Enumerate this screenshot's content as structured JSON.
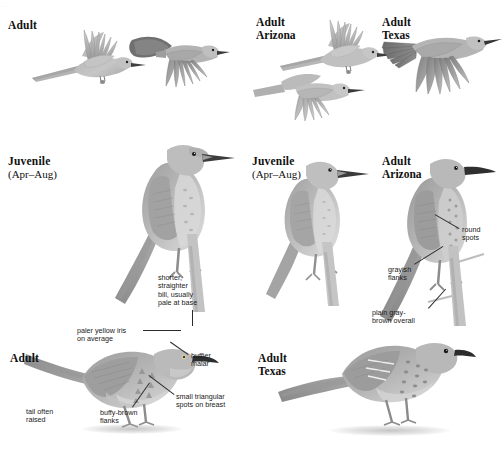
{
  "plate": {
    "width": 503,
    "height": 450,
    "background": "#ffffff",
    "partial_top_text": "…"
  },
  "palette": {
    "body_mid": "#a9a9a9",
    "body_light": "#c9c9c9",
    "body_pale": "#dcdcdc",
    "body_dark": "#8a8a8a",
    "wing_dark": "#6f6f6f",
    "bill_dark": "#3a3a3a",
    "text": "#101010",
    "anno_text": "#1a1a1a",
    "leader": "#2b2b2b",
    "shadow": "#969696"
  },
  "captions": [
    {
      "id": "adult-flight-left",
      "line1": "Adult",
      "line2": "",
      "x": 8,
      "y": 19
    },
    {
      "id": "adult-arizona-flight",
      "line1": "Adult",
      "line2": "Arizona",
      "x": 256,
      "y": 16
    },
    {
      "id": "adult-texas-flight",
      "line1": "Adult",
      "line2": "Texas",
      "x": 382,
      "y": 16
    },
    {
      "id": "juvenile-left",
      "line1": "Juvenile",
      "line2": "(Apr–Aug)",
      "x": 8,
      "y": 155
    },
    {
      "id": "juvenile-mid",
      "line1": "Juvenile",
      "line2": "(Apr–Aug)",
      "x": 252,
      "y": 155
    },
    {
      "id": "adult-arizona-perch",
      "line1": "Adult",
      "line2": "Arizona",
      "x": 382,
      "y": 155
    },
    {
      "id": "adult-perch-left",
      "line1": "Adult",
      "line2": "",
      "x": 10,
      "y": 352
    },
    {
      "id": "adult-texas-perch",
      "line1": "Adult",
      "line2": "Texas",
      "x": 258,
      "y": 352
    }
  ],
  "annotations": [
    {
      "id": "shorter-bill",
      "text": "shorter,\nstraighter\nbill, usually\npale at base",
      "x": 158,
      "y": 274
    },
    {
      "id": "round-spots",
      "text": "round\nspots",
      "x": 462,
      "y": 226
    },
    {
      "id": "grayish-flanks",
      "text": "grayish\nflanks",
      "x": 388,
      "y": 266
    },
    {
      "id": "plain-gray",
      "text": "plain gray-\nbrown overall",
      "x": 372,
      "y": 309
    },
    {
      "id": "paler-iris",
      "text": "paler yellow iris\non average",
      "x": 77,
      "y": 327
    },
    {
      "id": "buffier-malar",
      "text": "buffier\nmalar",
      "x": 191,
      "y": 352
    },
    {
      "id": "small-spots",
      "text": "small triangular\nspots on breast",
      "x": 176,
      "y": 393
    },
    {
      "id": "tail-raised",
      "text": "tail often\nraised",
      "x": 26,
      "y": 408
    },
    {
      "id": "buffy-flanks",
      "text": "buffy-brown\nflanks",
      "x": 100,
      "y": 409
    }
  ],
  "birds": [
    {
      "id": "flight-adult-upper-left",
      "pose": "flight-spread",
      "x": 30,
      "y": 28,
      "w": 110,
      "h": 60
    },
    {
      "id": "flight-adult-right",
      "pose": "flight-folded",
      "x": 126,
      "y": 32,
      "w": 100,
      "h": 58
    },
    {
      "id": "flight-arizona-upper",
      "pose": "flight-spread",
      "x": 280,
      "y": 20,
      "w": 110,
      "h": 58
    },
    {
      "id": "flight-arizona-lower",
      "pose": "flight-folded",
      "x": 255,
      "y": 68,
      "w": 110,
      "h": 52
    },
    {
      "id": "flight-texas",
      "pose": "flight-spread",
      "x": 382,
      "y": 26,
      "w": 115,
      "h": 70
    },
    {
      "id": "perch-juvenile-large",
      "pose": "perched-upright",
      "x": 98,
      "y": 128,
      "w": 135,
      "h": 180
    },
    {
      "id": "perch-juvenile-mid",
      "pose": "perched-upright",
      "x": 255,
      "y": 148,
      "w": 115,
      "h": 155
    },
    {
      "id": "perch-adult-arizona",
      "pose": "perched-upright",
      "x": 375,
      "y": 148,
      "w": 120,
      "h": 175
    },
    {
      "id": "perch-adult-left",
      "pose": "perched-ground",
      "x": 22,
      "y": 330,
      "w": 190,
      "h": 100
    },
    {
      "id": "perch-adult-texas",
      "pose": "perched-ground",
      "x": 270,
      "y": 332,
      "w": 200,
      "h": 100
    }
  ],
  "grounds": [
    {
      "id": "ground-adult-left",
      "x": 82,
      "y": 424,
      "w": 100,
      "h": 10
    },
    {
      "id": "ground-adult-texas",
      "x": 330,
      "y": 425,
      "w": 120,
      "h": 11
    }
  ]
}
